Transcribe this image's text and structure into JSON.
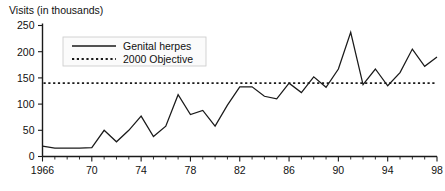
{
  "chart_data": {
    "type": "line",
    "title": "Visits (in thousands)",
    "xlabel": "",
    "ylabel": "Visits (in thousands)",
    "xlim": [
      1966,
      1998
    ],
    "ylim": [
      0,
      250
    ],
    "yticks": [
      0,
      50,
      100,
      150,
      200,
      250
    ],
    "ytick_labels": [
      "0",
      "50",
      "100",
      "150",
      "200",
      "250"
    ],
    "xticks": [
      1966,
      1970,
      1974,
      1978,
      1982,
      1986,
      1990,
      1994,
      1998
    ],
    "xtick_labels": [
      "1966",
      "70",
      "74",
      "78",
      "82",
      "86",
      "90",
      "94",
      "98"
    ],
    "minor_xticks_every": 1,
    "grid": false,
    "legend_position": "upper-left-inside",
    "x": [
      1966,
      1967,
      1968,
      1969,
      1970,
      1971,
      1972,
      1973,
      1974,
      1975,
      1976,
      1977,
      1978,
      1979,
      1980,
      1981,
      1982,
      1983,
      1984,
      1985,
      1986,
      1987,
      1988,
      1989,
      1990,
      1991,
      1992,
      1993,
      1994,
      1995,
      1996,
      1997,
      1998
    ],
    "series": [
      {
        "name": "Genital herpes",
        "style": "solid",
        "color": "#1a1a1a",
        "values": [
          20,
          16,
          16,
          16,
          17,
          50,
          28,
          50,
          77,
          38,
          58,
          118,
          80,
          88,
          58,
          98,
          133,
          133,
          115,
          110,
          140,
          122,
          152,
          132,
          167,
          237,
          137,
          167,
          135,
          160,
          205,
          172,
          190
        ]
      },
      {
        "name": "2000 Objective",
        "style": "dotted",
        "color": "#1a1a1a",
        "constant_value": 140,
        "values": [
          140,
          140,
          140,
          140,
          140,
          140,
          140,
          140,
          140,
          140,
          140,
          140,
          140,
          140,
          140,
          140,
          140,
          140,
          140,
          140,
          140,
          140,
          140,
          140,
          140,
          140,
          140,
          140,
          140,
          140,
          140,
          140,
          140
        ]
      }
    ],
    "legend": [
      {
        "label": "Genital herpes",
        "style": "solid"
      },
      {
        "label": "2000 Objective",
        "style": "dotted"
      }
    ]
  }
}
